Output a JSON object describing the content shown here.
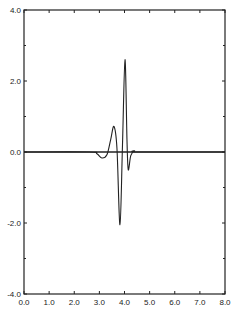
{
  "chart_data": {
    "type": "line",
    "title": "",
    "xlabel": "",
    "ylabel": "",
    "xlim": [
      0.0,
      8.0
    ],
    "ylim": [
      -4.0,
      4.0
    ],
    "grid": false,
    "legend": null,
    "x_ticks": [
      "0.0",
      "1.0",
      "2.0",
      "3.0",
      "4.0",
      "5.0",
      "6.0",
      "7.0",
      "8.0"
    ],
    "y_ticks": [
      "-4.0",
      "-2.0",
      "0.0",
      "2.0",
      "4.0"
    ],
    "series": [
      {
        "name": "waveform",
        "color": "#222222",
        "x": [
          0.0,
          2.6,
          2.9,
          3.1,
          3.3,
          3.45,
          3.58,
          3.7,
          3.82,
          3.92,
          4.02,
          4.1,
          4.15,
          4.25,
          4.4,
          4.6,
          8.0
        ],
        "y": [
          0.0,
          0.0,
          -0.05,
          -0.17,
          -0.08,
          0.35,
          0.72,
          0.1,
          -2.05,
          0.2,
          2.6,
          0.3,
          -0.5,
          -0.1,
          0.03,
          0.0,
          0.0
        ]
      }
    ]
  }
}
